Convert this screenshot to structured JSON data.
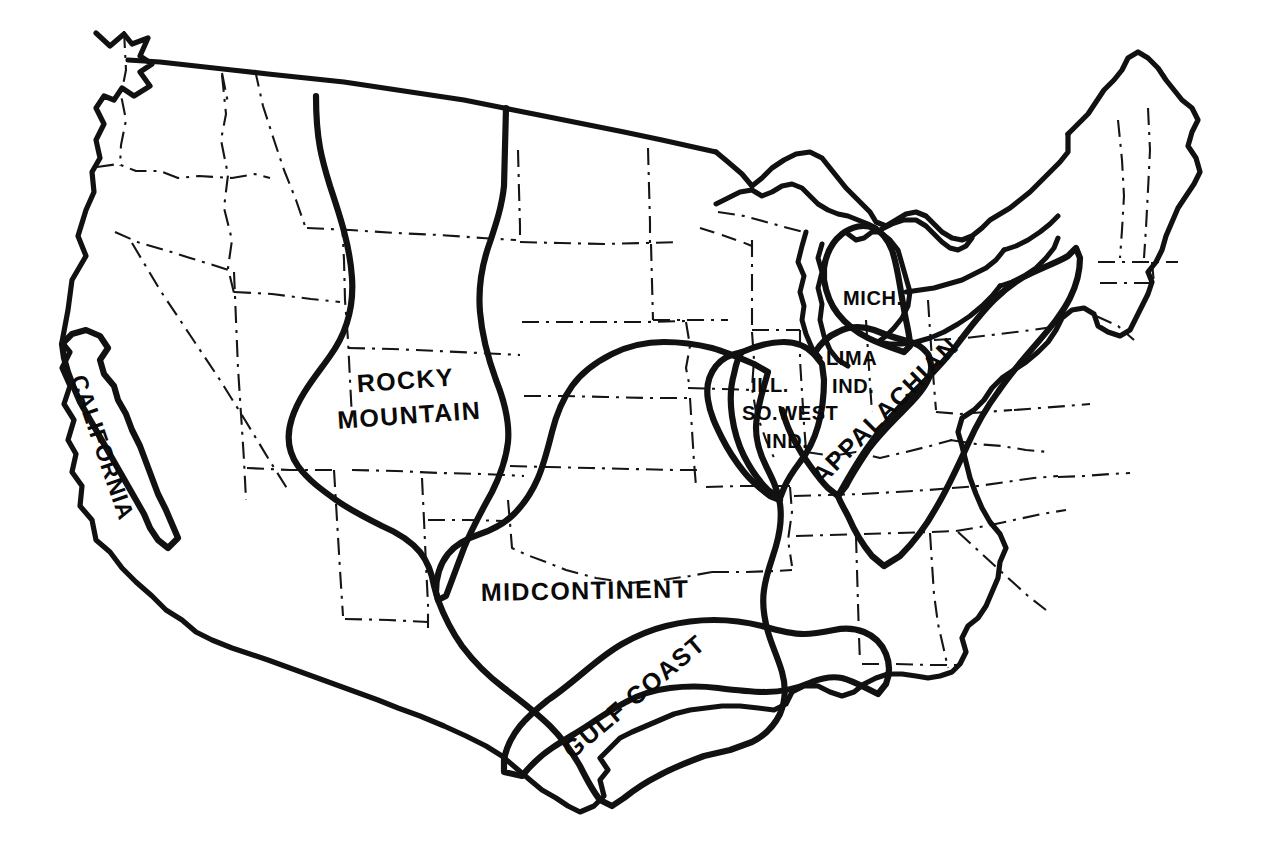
{
  "map": {
    "title": "Petroleum Provinces of the United States",
    "background_color": "#ffffff",
    "ink_color": "#111111",
    "width": 1264,
    "height": 842,
    "region_outline_style": "thick-solid",
    "state_border_style": "thin-dash-dot",
    "provinces": [
      {
        "id": "california",
        "label": "CALIFORNIA",
        "label_lines": [
          "CALIFORNIA"
        ],
        "label_rotation_deg": 71,
        "label_x": 95,
        "label_y": 450,
        "label_size": "lbl-med"
      },
      {
        "id": "rocky-mountain",
        "label": "ROCKY MOUNTAIN",
        "label_lines": [
          "ROCKY",
          "MOUNTAIN"
        ],
        "label_rotation_deg": -4,
        "label_x": 360,
        "label_y": 385,
        "label_size": "lbl-big"
      },
      {
        "id": "midcontinent",
        "label": "MIDCONTINENT",
        "label_lines": [
          "MIDCONTINENT"
        ],
        "label_rotation_deg": -1,
        "label_x": 481,
        "label_y": 601,
        "label_size": "lbl-big"
      },
      {
        "id": "gulf-coast",
        "label": "GULF COAST",
        "label_lines": [
          "GULF COAST"
        ],
        "label_rotation_deg": -40,
        "label_x": 572,
        "label_y": 760,
        "label_size": "lbl-big"
      },
      {
        "id": "illinois-southwest-indiana",
        "label": "ILL. SO.WEST IND.",
        "label_lines": [
          "ILL.",
          "SO.WEST",
          "IND."
        ],
        "label_rotation_deg": 0,
        "label_x": 745,
        "label_y": 392,
        "label_size": "lbl-small"
      },
      {
        "id": "lima-indiana",
        "label": "LIMA IND.",
        "label_lines": [
          "LIMA",
          "IND."
        ],
        "label_rotation_deg": 0,
        "label_x": 823,
        "label_y": 365,
        "label_size": "lbl-small"
      },
      {
        "id": "michigan",
        "label": "MICH.",
        "label_lines": [
          "MICH."
        ],
        "label_rotation_deg": 0,
        "label_x": 843,
        "label_y": 305,
        "label_size": "lbl-small"
      },
      {
        "id": "appalachian",
        "label": "APPALACHIAN",
        "label_lines": [
          "APPALACHIAN"
        ],
        "label_rotation_deg": -45,
        "label_x": 822,
        "label_y": 486,
        "label_size": "lbl-big"
      }
    ]
  }
}
